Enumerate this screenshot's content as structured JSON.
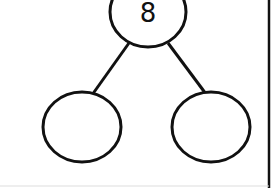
{
  "diagram": {
    "type": "number-bond",
    "whole": {
      "value": "8"
    },
    "parts": [
      {
        "value": ""
      },
      {
        "value": ""
      }
    ],
    "stroke_color": "#111111",
    "background": "#ffffff"
  }
}
